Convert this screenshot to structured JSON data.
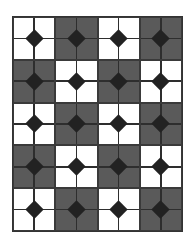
{
  "pattern": {
    "rows": 5,
    "cols": 4,
    "colors": {
      "light": "#ffffff",
      "dark": "#5a5a5a",
      "line": "#2e2e2e",
      "diamond": "#222222"
    },
    "tiles": [
      [
        "light",
        "dark",
        "light",
        "dark"
      ],
      [
        "dark",
        "light",
        "dark",
        "light"
      ],
      [
        "light",
        "dark",
        "light",
        "dark"
      ],
      [
        "dark",
        "light",
        "dark",
        "light"
      ],
      [
        "light",
        "dark",
        "light",
        "dark"
      ]
    ]
  }
}
